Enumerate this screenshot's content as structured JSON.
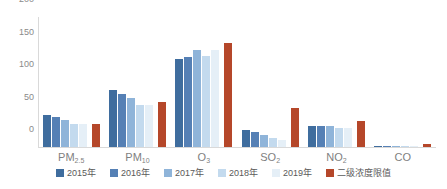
{
  "chart_data": {
    "type": "bar",
    "title": "",
    "subtitle": "",
    "xlabel": "",
    "ylabel": "",
    "ylim": [
      0,
      200
    ],
    "yticks": [
      0,
      50,
      100,
      150,
      200
    ],
    "grid": false,
    "legend_position": "bottom",
    "categories": [
      "PM2.5",
      "PM10",
      "O3",
      "SO2",
      "NO2",
      "CO"
    ],
    "category_labels": [
      {
        "base": "PM",
        "sub": "2.5"
      },
      {
        "base": "PM",
        "sub": "10"
      },
      {
        "base": "O",
        "sub": "3"
      },
      {
        "base": "SO",
        "sub": "2"
      },
      {
        "base": "NO",
        "sub": "2"
      },
      {
        "base": "CO",
        "sub": ""
      }
    ],
    "series": [
      {
        "name": "2015年",
        "color": "#3f6d9e",
        "values": [
          49,
          87,
          135,
          26,
          32,
          1.5
        ]
      },
      {
        "name": "2016年",
        "color": "#5580b5",
        "values": [
          46,
          82,
          139,
          23,
          32,
          1.4
        ]
      },
      {
        "name": "2017年",
        "color": "#8fb4d9",
        "values": [
          42,
          76,
          150,
          19,
          33,
          1.3
        ]
      },
      {
        "name": "2018年",
        "color": "#c3daee",
        "values": [
          36,
          64,
          140,
          14,
          29,
          1.2
        ]
      },
      {
        "name": "2019年",
        "color": "#e5eff7",
        "values": [
          35,
          64,
          149,
          11,
          30,
          1.1
        ]
      },
      {
        "name": "二级浓度限值",
        "color": "#b5472a",
        "values": [
          35,
          70,
          160,
          60,
          40,
          4
        ]
      }
    ]
  },
  "axis": {
    "y_tick_labels": [
      "200",
      "150",
      "100",
      "50",
      "0"
    ]
  }
}
